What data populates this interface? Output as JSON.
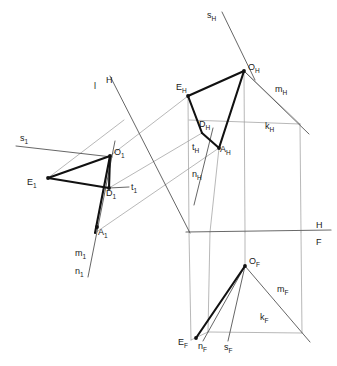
{
  "figure": {
    "type": "technical-line-drawing",
    "canvas": {
      "width": 337,
      "height": 366
    },
    "colors": {
      "thick_stroke": "#111111",
      "thin_stroke": "#4a4a4a",
      "auxiliary_stroke": "#9a9a9a",
      "ground_line": "#6a6a6a",
      "background": "#ffffff",
      "label_text": "#1a1a1a"
    },
    "views": [
      {
        "key": "rotated",
        "suffix": "1",
        "description": "auxiliary / rotated view, left"
      },
      {
        "key": "horizontal",
        "suffix": "H",
        "description": "top (horizontal) projection, upper right"
      },
      {
        "key": "frontal",
        "suffix": "F",
        "description": "front (frontal) projection, lower right"
      }
    ]
  },
  "labels": [
    {
      "name": "label-s1",
      "base": "s",
      "sub": "1",
      "x": 20,
      "y": 141
    },
    {
      "name": "label-O1",
      "base": "O",
      "sub": "1",
      "x": 114,
      "y": 155
    },
    {
      "name": "label-E1",
      "base": "E",
      "sub": "1",
      "x": 27,
      "y": 185
    },
    {
      "name": "label-D1",
      "base": "D",
      "sub": "1",
      "x": 106,
      "y": 196
    },
    {
      "name": "label-t1",
      "base": "t",
      "sub": "1",
      "x": 131,
      "y": 190
    },
    {
      "name": "label-A1",
      "base": "A",
      "sub": "1",
      "x": 98,
      "y": 235
    },
    {
      "name": "label-m1",
      "base": "m",
      "sub": "1",
      "x": 75,
      "y": 256
    },
    {
      "name": "label-n1",
      "base": "n",
      "sub": "1",
      "x": 75,
      "y": 274
    },
    {
      "name": "label-l",
      "base": "l",
      "sub": "",
      "x": 94,
      "y": 89
    },
    {
      "name": "label-H-axis-top",
      "base": "H",
      "sub": "",
      "x": 106,
      "y": 83
    },
    {
      "name": "label-sH",
      "base": "s",
      "sub": "H",
      "x": 207,
      "y": 18
    },
    {
      "name": "label-OH",
      "base": "O",
      "sub": "H",
      "x": 248,
      "y": 70
    },
    {
      "name": "label-EH",
      "base": "E",
      "sub": "H",
      "x": 176,
      "y": 90
    },
    {
      "name": "label-mH",
      "base": "m",
      "sub": "H",
      "x": 275,
      "y": 92
    },
    {
      "name": "label-DH",
      "base": "D",
      "sub": "H",
      "x": 199,
      "y": 127
    },
    {
      "name": "label-kH",
      "base": "k",
      "sub": "H",
      "x": 265,
      "y": 129
    },
    {
      "name": "label-AH",
      "base": "A",
      "sub": "H",
      "x": 220,
      "y": 152
    },
    {
      "name": "label-tH",
      "base": "t",
      "sub": "H",
      "x": 192,
      "y": 150
    },
    {
      "name": "label-nH",
      "base": "n",
      "sub": "H",
      "x": 192,
      "y": 177
    },
    {
      "name": "label-H-ground",
      "base": "H",
      "sub": "",
      "x": 316,
      "y": 228
    },
    {
      "name": "label-F-ground",
      "base": "F",
      "sub": "",
      "x": 316,
      "y": 245
    },
    {
      "name": "label-OF",
      "base": "O",
      "sub": "F",
      "x": 249,
      "y": 264
    },
    {
      "name": "label-mF",
      "base": "m",
      "sub": "F",
      "x": 277,
      "y": 292
    },
    {
      "name": "label-kF",
      "base": "k",
      "sub": "F",
      "x": 260,
      "y": 320
    },
    {
      "name": "label-EF",
      "base": "E",
      "sub": "F",
      "x": 178,
      "y": 345
    },
    {
      "name": "label-nF",
      "base": "n",
      "sub": "F",
      "x": 198,
      "y": 349
    },
    {
      "name": "label-sF",
      "base": "s",
      "sub": "F",
      "x": 224,
      "y": 350
    }
  ],
  "geometry": {
    "ground_line": {
      "name": "ground-line-HF",
      "x1": 186,
      "y1": 232,
      "x2": 331,
      "y2": 230
    },
    "thick_segments": [
      {
        "name": "seg-E1-O1",
        "x1": 48,
        "y1": 178,
        "x2": 110,
        "y2": 156
      },
      {
        "name": "seg-O1-D1",
        "x1": 110,
        "y1": 156,
        "x2": 109,
        "y2": 188
      },
      {
        "name": "seg-E1-D1",
        "x1": 48,
        "y1": 178,
        "x2": 109,
        "y2": 188
      },
      {
        "name": "seg-A1-O1",
        "x1": 95,
        "y1": 233,
        "x2": 110,
        "y2": 156
      },
      {
        "name": "seg-EH-OH",
        "x1": 188,
        "y1": 96,
        "x2": 244,
        "y2": 71
      },
      {
        "name": "seg-EH-DH",
        "x1": 188,
        "y1": 96,
        "x2": 202,
        "y2": 133
      },
      {
        "name": "seg-DH-AH",
        "x1": 202,
        "y1": 133,
        "x2": 219,
        "y2": 148
      },
      {
        "name": "seg-AH-OH",
        "x1": 219,
        "y1": 148,
        "x2": 244,
        "y2": 71
      },
      {
        "name": "seg-EF-OF",
        "x1": 196,
        "y1": 338,
        "x2": 245,
        "y2": 266
      }
    ],
    "thin_segments": [
      {
        "name": "line-s1",
        "x1": 16,
        "y1": 146,
        "x2": 112,
        "y2": 157
      },
      {
        "name": "line-t1",
        "x1": 109,
        "y1": 188,
        "x2": 129,
        "y2": 187
      },
      {
        "name": "line-m1-n1",
        "x1": 115,
        "y1": 141,
        "x2": 88,
        "y2": 277
      },
      {
        "name": "line-lH",
        "x1": 110,
        "y1": 76,
        "x2": 190,
        "y2": 233
      },
      {
        "name": "line-sH",
        "x1": 222,
        "y1": 12,
        "x2": 255,
        "y2": 80
      },
      {
        "name": "line-mH",
        "x1": 244,
        "y1": 71,
        "x2": 309,
        "y2": 134
      },
      {
        "name": "line-tH-nH",
        "x1": 213,
        "y1": 128,
        "x2": 194,
        "y2": 205
      },
      {
        "name": "line-OF-sF",
        "x1": 245,
        "y1": 266,
        "x2": 228,
        "y2": 341
      },
      {
        "name": "line-OF-nF",
        "x1": 245,
        "y1": 266,
        "x2": 203,
        "y2": 341
      },
      {
        "name": "line-mF",
        "x1": 245,
        "y1": 266,
        "x2": 310,
        "y2": 342
      }
    ],
    "auxiliary_segments": [
      {
        "name": "aux-corr-1",
        "x1": 110,
        "y1": 156,
        "x2": 188,
        "y2": 96
      },
      {
        "name": "aux-corr-2",
        "x1": 109,
        "y1": 188,
        "x2": 202,
        "y2": 133
      },
      {
        "name": "aux-corr-3",
        "x1": 95,
        "y1": 233,
        "x2": 219,
        "y2": 148
      },
      {
        "name": "aux-corr-4",
        "x1": 48,
        "y1": 178,
        "x2": 124,
        "y2": 120
      },
      {
        "name": "aux-proj-EH",
        "x1": 188,
        "y1": 96,
        "x2": 189,
        "y2": 232
      },
      {
        "name": "aux-proj-EF",
        "x1": 189,
        "y1": 232,
        "x2": 191,
        "y2": 340
      },
      {
        "name": "aux-proj-AH",
        "x1": 219,
        "y1": 148,
        "x2": 210,
        "y2": 232
      },
      {
        "name": "aux-proj-AF",
        "x1": 210,
        "y1": 232,
        "x2": 208,
        "y2": 332
      },
      {
        "name": "aux-proj-OH",
        "x1": 244,
        "y1": 71,
        "x2": 245,
        "y2": 232
      },
      {
        "name": "aux-proj-OF",
        "x1": 245,
        "y1": 232,
        "x2": 245,
        "y2": 266
      },
      {
        "name": "aux-proj-kH",
        "x1": 300,
        "y1": 124,
        "x2": 301,
        "y2": 232
      },
      {
        "name": "aux-proj-kF",
        "x1": 301,
        "y1": 232,
        "x2": 302,
        "y2": 333
      },
      {
        "name": "aux-kH",
        "x1": 244,
        "y1": 71,
        "x2": 300,
        "y2": 124
      },
      {
        "name": "aux-kH-base",
        "x1": 189,
        "y1": 120,
        "x2": 300,
        "y2": 124
      },
      {
        "name": "aux-kF-base",
        "x1": 208,
        "y1": 332,
        "x2": 302,
        "y2": 333
      },
      {
        "name": "aux-kF-left",
        "x1": 191,
        "y1": 340,
        "x2": 208,
        "y2": 332
      }
    ],
    "arrow_markers": [
      {
        "name": "arrow-O1",
        "x": 110,
        "y": 156
      },
      {
        "name": "arrow-E1",
        "x": 48,
        "y": 178
      },
      {
        "name": "arrow-D1",
        "x": 109,
        "y": 188
      },
      {
        "name": "arrow-A1",
        "x": 97,
        "y": 227
      },
      {
        "name": "arrow-OH",
        "x": 244,
        "y": 71
      },
      {
        "name": "arrow-AH",
        "x": 219,
        "y": 148
      },
      {
        "name": "arrow-EH",
        "x": 188,
        "y": 96
      },
      {
        "name": "arrow-OF",
        "x": 245,
        "y": 266
      },
      {
        "name": "arrow-EF",
        "x": 196,
        "y": 338
      }
    ]
  }
}
